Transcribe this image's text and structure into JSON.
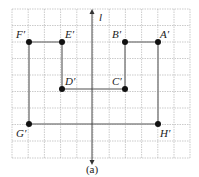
{
  "figure": {
    "caption": "(a)",
    "axis_label": "l",
    "grid": {
      "x0": 12,
      "y0": 9,
      "cols": 11,
      "rows": 9,
      "cell_w": 16.2,
      "cell_h": 16.5,
      "color": "#9a9a9a"
    },
    "colors": {
      "line": "#8a8a8a",
      "dot": "#111111",
      "axis": "#333333"
    },
    "points": [
      {
        "name": "F′",
        "x": 29,
        "y": 42
      },
      {
        "name": "E′",
        "x": 62,
        "y": 42
      },
      {
        "name": "D′",
        "x": 62,
        "y": 89
      },
      {
        "name": "C′",
        "x": 125,
        "y": 89
      },
      {
        "name": "B′",
        "x": 125,
        "y": 42
      },
      {
        "name": "A′",
        "x": 158,
        "y": 42
      },
      {
        "name": "H′",
        "x": 158,
        "y": 124
      },
      {
        "name": "G′",
        "x": 29,
        "y": 124
      }
    ],
    "labels": {
      "F": "F′",
      "E": "E′",
      "D": "D′",
      "C": "C′",
      "B": "B′",
      "A": "A′",
      "G": "G′",
      "H": "H′"
    }
  }
}
